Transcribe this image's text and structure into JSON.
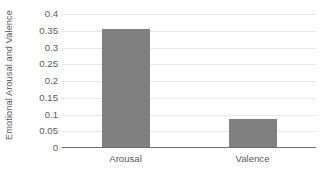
{
  "chart_data": {
    "type": "bar",
    "title": "",
    "subtitle": "",
    "categories": [
      "Arousal",
      "Valence"
    ],
    "values": [
      0.355,
      0.086
    ],
    "series": [
      {
        "name": "Emotional Arousal and Valence",
        "values": [
          0.355,
          0.086
        ]
      }
    ],
    "xlabel": "",
    "ylabel": "Emotional Arousal and Valence",
    "ylim": [
      0,
      0.4
    ],
    "yticks": [
      0,
      0.05,
      0.1,
      0.15,
      0.2,
      0.25,
      0.3,
      0.35,
      0.4
    ],
    "ytick_labels": [
      "0",
      "0.05",
      "0.1",
      "0.15",
      "0.2",
      "0.25",
      "0.3",
      "0.35",
      "0.4"
    ],
    "grid": "horizontal",
    "legend": "none",
    "bar_color": "#808080",
    "gridline_color": "#E6E6E6",
    "axis_color": "#6B6B6B",
    "text_color": "#595959",
    "background": "#FFFFFF"
  }
}
